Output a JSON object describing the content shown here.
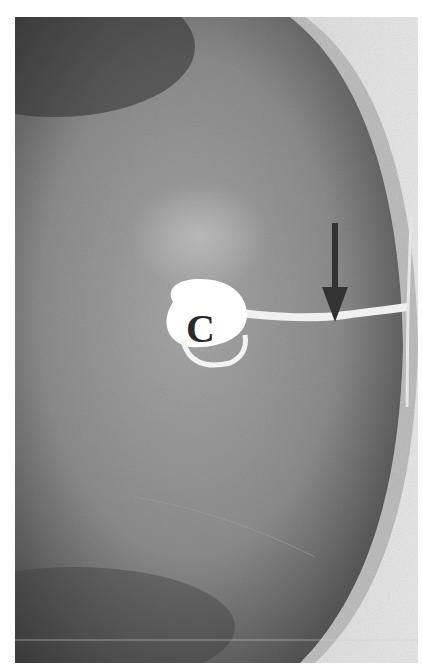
{
  "figure": {
    "labels": {
      "cavity_label": "C"
    },
    "annotations": [
      {
        "type": "arrow",
        "direction": "down",
        "color": "#333333",
        "points_to": "channel joining cavity to outer capsule"
      }
    ],
    "colors": {
      "background": "#ffffff",
      "tissue_dark": "#3c3c3c",
      "tissue_mid": "#8c8c8c",
      "tissue_light": "#b4b4b4",
      "cavity": "#ffffff",
      "capsule": "#c8c8c8",
      "arrow": "#333333"
    }
  }
}
